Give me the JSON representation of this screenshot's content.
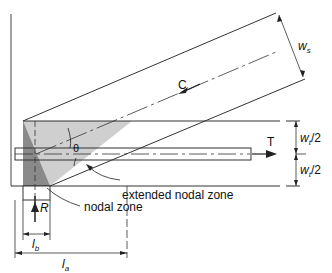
{
  "diagram": {
    "labels": {
      "strut_width": "w",
      "strut_width_sub": "s",
      "compression": "C",
      "tension": "T",
      "tie_half_width_top": "w",
      "tie_half_width_top_sub": "t",
      "tie_half_width_top_suffix": "/2",
      "tie_half_width_bottom": "w",
      "tie_half_width_bottom_sub": "t",
      "tie_half_width_bottom_suffix": "/2",
      "angle": "θ",
      "extended_nodal_zone": "extended nodal zone",
      "nodal_zone": "nodal zone",
      "reaction": "R",
      "bearing_length": "l",
      "bearing_length_sub": "b",
      "anchorage_length": "l",
      "anchorage_length_sub": "a"
    },
    "colors": {
      "line": "#222222",
      "extended_zone_fill": "#cfcfcf",
      "nodal_zone_fill": "#8a8a8a"
    }
  }
}
